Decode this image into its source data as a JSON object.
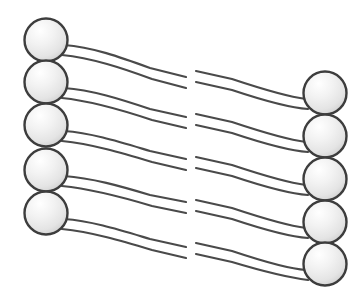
{
  "diagram": {
    "background_color": "#ffffff",
    "head_fill_light": "#fdfdfd",
    "head_fill_mid": "#ececec",
    "head_fill_dark": "#d2d2d2",
    "head_stroke_color": "#3d3d3d",
    "tail_stroke_color": "#4a4a4a",
    "head_radius": 21.5,
    "head_stroke_width": 2.4,
    "tail_stroke_width": 2.2,
    "tail_gap_x_left": 186,
    "tail_gap_x_right": 196,
    "leaflets": [
      {
        "name": "left-leaflet",
        "label": "left-leaflet",
        "head_count": 5,
        "direction": "tails-point-right",
        "heads": [
          {
            "name": "left-head-1",
            "cx": 46,
            "cy": 40
          },
          {
            "name": "left-head-2",
            "cx": 46,
            "cy": 82
          },
          {
            "name": "left-head-3",
            "cx": 46,
            "cy": 125
          },
          {
            "name": "left-head-4",
            "cx": 46,
            "cy": 170
          },
          {
            "name": "left-head-5",
            "cx": 46,
            "cy": 213
          }
        ],
        "tails": [
          {
            "name": "left-tail-1",
            "upper": "M 64 45 C 92 47 120 57 150 68 L 186 77",
            "lower": "M 62 55 C 92 58 122 68 152 79 L 186 88"
          },
          {
            "name": "left-tail-2",
            "upper": "M 64 88 C 92 90 120 99 150 109 L 186 117",
            "lower": "M 62 98 C 92 101 122 110 152 120 L 186 128"
          },
          {
            "name": "left-tail-3",
            "upper": "M 64 131 C 92 133 120 142 150 151 L 186 159",
            "lower": "M 62 141 C 92 144 122 153 152 162 L 186 170"
          },
          {
            "name": "left-tail-4",
            "upper": "M 64 176 C 92 178 120 186 150 195 L 186 202",
            "lower": "M 62 186 C 92 189 122 197 152 206 L 186 213"
          },
          {
            "name": "left-tail-5",
            "upper": "M 64 219 C 92 221 120 230 150 239 L 186 247",
            "lower": "M 62 229 C 92 232 122 241 152 250 L 186 258"
          }
        ]
      },
      {
        "name": "right-leaflet",
        "label": "right-leaflet",
        "head_count": 5,
        "direction": "tails-point-left",
        "heads": [
          {
            "name": "right-head-1",
            "cx": 325,
            "cy": 93
          },
          {
            "name": "right-head-2",
            "cx": 325,
            "cy": 136
          },
          {
            "name": "right-head-3",
            "cx": 325,
            "cy": 179
          },
          {
            "name": "right-head-4",
            "cx": 325,
            "cy": 222
          },
          {
            "name": "right-head-5",
            "cx": 325,
            "cy": 264
          }
        ],
        "tails": [
          {
            "name": "right-tail-1",
            "upper": "M 196 71 L 232 79 C 262 89 290 97 306 99",
            "lower": "M 196 82 L 232 90 C 262 100 292 108 308 109"
          },
          {
            "name": "right-tail-2",
            "upper": "M 196 114 L 232 122 C 262 132 290 140 306 142",
            "lower": "M 196 125 L 232 133 C 262 143 292 151 308 152"
          },
          {
            "name": "right-tail-3",
            "upper": "M 196 157 L 232 165 C 262 175 290 183 306 185",
            "lower": "M 196 168 L 232 176 C 262 186 292 194 308 195"
          },
          {
            "name": "right-tail-4",
            "upper": "M 196 200 L 232 208 C 262 218 290 226 306 228",
            "lower": "M 196 211 L 232 219 C 262 229 292 237 308 238"
          },
          {
            "name": "right-tail-5",
            "upper": "M 196 243 L 232 251 C 262 261 290 269 306 270",
            "lower": "M 196 254 L 232 262 C 262 271 292 278 308 280"
          }
        ]
      }
    ]
  }
}
